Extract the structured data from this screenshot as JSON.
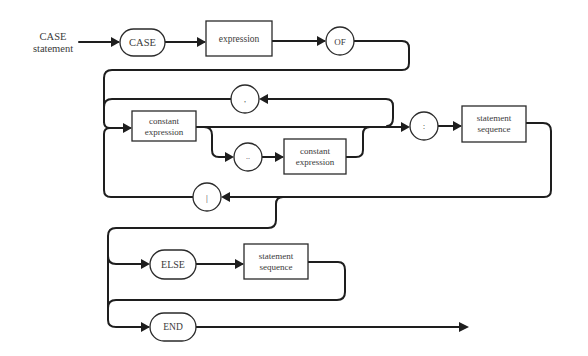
{
  "diagram": {
    "title_line1": "CASE",
    "title_line2": "statement",
    "nodes": {
      "case_kw": "CASE",
      "expression": "expression",
      "of_kw": "OF",
      "comma": ",",
      "const_expr_1_line1": "constant",
      "const_expr_1_line2": "expression",
      "range": "..",
      "const_expr_2_line1": "constant",
      "const_expr_2_line2": "expression",
      "colon": ":",
      "stmt_seq_1_line1": "statement",
      "stmt_seq_1_line2": "sequence",
      "bar": "|",
      "else_kw": "ELSE",
      "stmt_seq_2_line1": "statement",
      "stmt_seq_2_line2": "sequence",
      "end_kw": "END"
    },
    "colors": {
      "line": "#1e1e1e",
      "text": "#3a3a3a",
      "background": "#ffffff"
    }
  }
}
